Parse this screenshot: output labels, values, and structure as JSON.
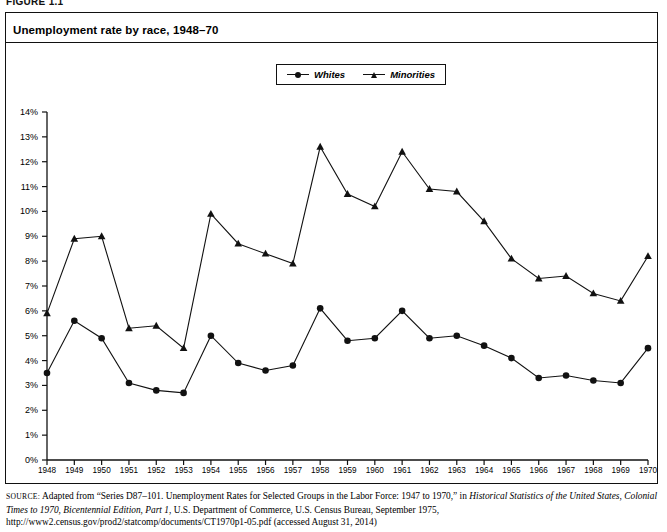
{
  "figure": {
    "label": "FIGURE 1.1",
    "title": "Unemployment rate by race, 1948–70"
  },
  "legend": {
    "position": "top-center",
    "items": [
      {
        "label": "Whites",
        "marker": "circle-marker-icon"
      },
      {
        "label": "Minorities",
        "marker": "triangle-marker-icon"
      }
    ]
  },
  "source": {
    "prefix": "SOURCE:",
    "part1": " Adapted from “Series D87–101. Unemployment Rates for Selected Groups in the Labor Force: 1947 to 1970,” in ",
    "italic1": "Historical Statistics of the United States, Colonial Times to 1970, Bicentennial Edition, Part 1",
    "part2": ", U.S. Department of Commerce, U.S. Census Bureau, September 1975, http://www2.census.gov/prod2/statcomp/documents/CT1970p1-05.pdf (accessed August 31, 2014)"
  },
  "chart_data": {
    "type": "line",
    "title": "Unemployment rate by race, 1948–70",
    "xlabel": "",
    "ylabel": "",
    "grid": false,
    "legend_position": "top-center",
    "ylim": [
      0,
      14
    ],
    "ytick_labels": [
      "0%",
      "1%",
      "2%",
      "3%",
      "4%",
      "5%",
      "6%",
      "7%",
      "8%",
      "9%",
      "10%",
      "11%",
      "12%",
      "13%",
      "14%"
    ],
    "ytick_values": [
      0,
      1,
      2,
      3,
      4,
      5,
      6,
      7,
      8,
      9,
      10,
      11,
      12,
      13,
      14
    ],
    "categories": [
      "1948",
      "1949",
      "1950",
      "1951",
      "1952",
      "1953",
      "1954",
      "1955",
      "1956",
      "1957",
      "1958",
      "1959",
      "1960",
      "1961",
      "1962",
      "1963",
      "1964",
      "1965",
      "1966",
      "1967",
      "1968",
      "1969",
      "1970"
    ],
    "series": [
      {
        "name": "Whites",
        "marker": "circle",
        "values": [
          3.5,
          5.6,
          4.9,
          3.1,
          2.8,
          2.7,
          5.0,
          3.9,
          3.6,
          3.8,
          6.1,
          4.8,
          4.9,
          6.0,
          4.9,
          5.0,
          4.6,
          4.1,
          3.3,
          3.4,
          3.2,
          3.1,
          4.5
        ]
      },
      {
        "name": "Minorities",
        "marker": "triangle",
        "values": [
          5.9,
          8.9,
          9.0,
          5.3,
          5.4,
          4.5,
          9.9,
          8.7,
          8.3,
          7.9,
          12.6,
          10.7,
          10.2,
          12.4,
          10.9,
          10.8,
          9.6,
          8.1,
          7.3,
          7.4,
          6.7,
          6.4,
          8.2
        ]
      }
    ]
  }
}
